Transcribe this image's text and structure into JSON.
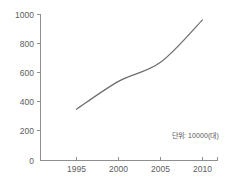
{
  "chart_data": {
    "type": "line",
    "title": "",
    "subtitle": "",
    "xlabel": "",
    "ylabel": "",
    "x": [
      1995,
      2000,
      2005,
      2010
    ],
    "categories": [
      "1995",
      "2000",
      "2005",
      "2010"
    ],
    "values": [
      350,
      540,
      670,
      960
    ],
    "series": [
      {
        "name": "",
        "values": [
          350,
          540,
          670,
          960
        ]
      }
    ],
    "xlim": [
      1993,
      2011
    ],
    "ylim": [
      0,
      1000
    ],
    "ytick_labels": [
      "0",
      "200",
      "400",
      "600",
      "800",
      "1000"
    ],
    "ytick_values": [
      0,
      200,
      400,
      600,
      800,
      1000
    ],
    "xtick_labels": [
      "1995",
      "2000",
      "2005",
      "2010"
    ],
    "xtick_values": [
      1995,
      2000,
      2005,
      2010
    ],
    "grid": false,
    "legend": false,
    "legend_position": "none",
    "annotations": [
      {
        "name": "unit-note",
        "text": "단위: 10000(대)",
        "position": "bottom-right"
      }
    ],
    "line_color": "#6d6d6d",
    "axis_color": "#8f8f8f",
    "text_color": "#5d5d5d",
    "background_color": "#ffffff",
    "markers": false
  }
}
